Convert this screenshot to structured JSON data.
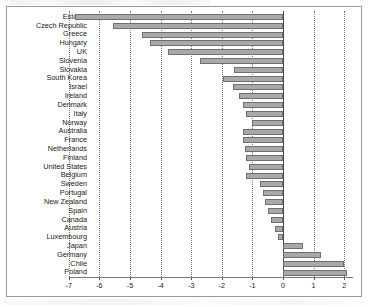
{
  "chart_data": {
    "type": "bar",
    "orientation": "horizontal",
    "title": "",
    "xlabel": "",
    "ylabel": "",
    "xlim": [
      -7.4,
      2.45
    ],
    "grid": true,
    "legend": false,
    "zero_reference_line": true,
    "xticks": [
      -7,
      -6,
      -5,
      -4,
      -3,
      -2,
      -1,
      0,
      1,
      2
    ],
    "xticklabels": [
      "-7",
      "-6",
      "-5",
      "-4",
      "-3",
      "-2",
      "-1",
      "0",
      "1",
      "2"
    ],
    "bar_color": "#a9a9a9",
    "bar_edge_color": "#6f6f6f",
    "categories": [
      "Estonia",
      "Czech Republic",
      "Greece",
      "Hungary",
      "UK",
      "Slovenia",
      "Slovakia",
      "South Korea",
      "Israel",
      "Ireland",
      "Denmark",
      "Italy",
      "Norway",
      "Australia",
      "France",
      "Netherlands",
      "Finland",
      "United States",
      "Belgium",
      "Sweden",
      "Portugal",
      "New Zealand",
      "Spain",
      "Canada",
      "Austria",
      "Luxembourg",
      "Japan",
      "Germany",
      "Chile",
      "Poland"
    ],
    "values": [
      -6.8,
      -5.55,
      -4.6,
      -4.35,
      -3.75,
      -2.7,
      -1.6,
      -1.95,
      -1.65,
      -1.45,
      -1.3,
      -1.2,
      -1.0,
      -1.3,
      -1.3,
      -1.25,
      -1.2,
      -1.1,
      -1.2,
      -0.75,
      -0.65,
      -0.6,
      -0.5,
      -0.4,
      -0.25,
      -0.15,
      0.65,
      1.25,
      2.0,
      2.1
    ]
  }
}
